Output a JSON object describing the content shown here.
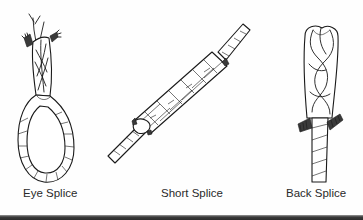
{
  "figure": {
    "items": [
      {
        "label": "Eye Splice",
        "icon": "eye-splice-illustration"
      },
      {
        "label": "Short Splice",
        "icon": "short-splice-illustration"
      },
      {
        "label": "Back Splice",
        "icon": "back-splice-illustration"
      }
    ]
  },
  "colors": {
    "background": "#fefefe",
    "ink": "#1a1a1a",
    "label": "#2a2a2a",
    "bottom_rule": "#2b2b2b"
  }
}
